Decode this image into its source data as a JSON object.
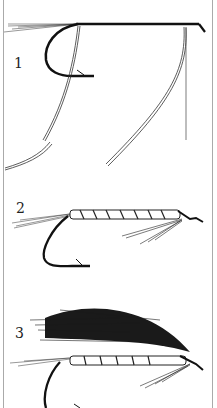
{
  "diagram": {
    "steps": [
      {
        "number": "1",
        "description": "Hook with tail fibers tied in, ribbing and body material attached"
      },
      {
        "number": "2",
        "description": "Body wrapped with ribbing, hackle fibers tied under"
      },
      {
        "number": "3",
        "description": "Completed fly with hair wing"
      }
    ],
    "colors": {
      "ink": "#1a1a1a",
      "paper": "#ffffff",
      "border": "#9a9a9a"
    }
  }
}
